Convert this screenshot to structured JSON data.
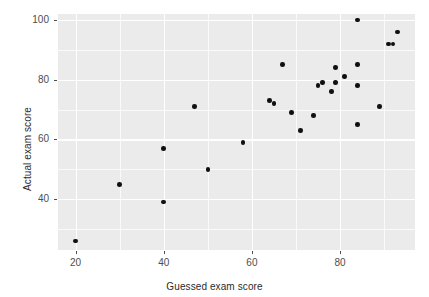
{
  "chart_data": {
    "type": "scatter",
    "title": "",
    "xlabel": "Guessed exam score",
    "ylabel": "Actual exam score",
    "xlim": [
      16,
      97
    ],
    "ylim": [
      23,
      102
    ],
    "xticks": [
      20,
      40,
      60,
      80
    ],
    "yticks": [
      40,
      60,
      80,
      100
    ],
    "xtick_labels": [
      "20",
      "40",
      "60",
      "80"
    ],
    "ytick_labels": [
      "40",
      "60",
      "80",
      "100"
    ],
    "grid": true,
    "grid_major": true,
    "grid_minor": true,
    "legend": "none",
    "panel_background": "#ebebeb",
    "grid_color": "#ffffff",
    "point_color": "#101010",
    "axis_text_color": "#4d4d4d",
    "axis_title_color": "#2b2b2b",
    "n_points": 27,
    "points": [
      {
        "x": 20,
        "y": 26
      },
      {
        "x": 30,
        "y": 45
      },
      {
        "x": 40,
        "y": 39
      },
      {
        "x": 40,
        "y": 57
      },
      {
        "x": 47,
        "y": 71
      },
      {
        "x": 50,
        "y": 50
      },
      {
        "x": 58,
        "y": 59
      },
      {
        "x": 64,
        "y": 73
      },
      {
        "x": 65,
        "y": 72
      },
      {
        "x": 67,
        "y": 85
      },
      {
        "x": 69,
        "y": 69
      },
      {
        "x": 71,
        "y": 63
      },
      {
        "x": 74,
        "y": 68
      },
      {
        "x": 75,
        "y": 78
      },
      {
        "x": 76,
        "y": 79
      },
      {
        "x": 78,
        "y": 76
      },
      {
        "x": 79,
        "y": 79
      },
      {
        "x": 79,
        "y": 84
      },
      {
        "x": 81,
        "y": 81
      },
      {
        "x": 84,
        "y": 78
      },
      {
        "x": 84,
        "y": 85
      },
      {
        "x": 84,
        "y": 65
      },
      {
        "x": 84,
        "y": 100
      },
      {
        "x": 89,
        "y": 71
      },
      {
        "x": 91,
        "y": 92
      },
      {
        "x": 92,
        "y": 92
      },
      {
        "x": 93,
        "y": 96
      }
    ]
  },
  "axes": {
    "x_title": "Guessed exam score",
    "y_title": "Actual exam score"
  }
}
